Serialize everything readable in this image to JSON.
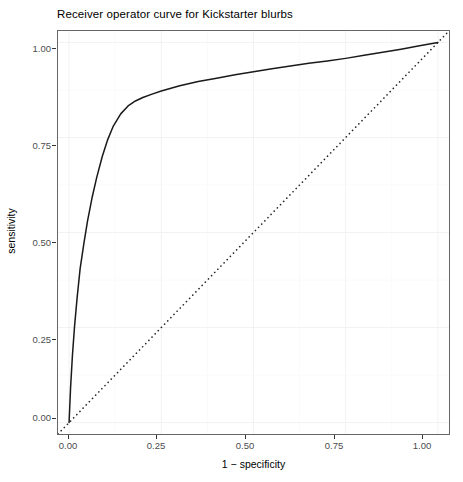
{
  "chart_data": {
    "type": "line",
    "title": "Receiver operator curve for Kickstarter blurbs",
    "xlabel": "1 − specificity",
    "ylabel": "sensitivity",
    "xlim": [
      -0.03,
      1.03
    ],
    "ylim": [
      -0.03,
      1.03
    ],
    "grid": true,
    "legend": "none",
    "x_ticks": [
      0.0,
      0.25,
      0.5,
      0.75,
      1.0
    ],
    "x_tick_labels": [
      "0.00",
      "0.25",
      "0.50",
      "0.75",
      "1.00"
    ],
    "y_ticks": [
      0.0,
      0.25,
      0.5,
      0.75,
      1.0
    ],
    "y_tick_labels": [
      "0.00",
      "0.25",
      "0.50",
      "0.75",
      "1.00"
    ],
    "series": [
      {
        "name": "roc-curve",
        "style": "solid",
        "color": "#1a1a1a",
        "x": [
          0.0,
          0.004,
          0.009,
          0.015,
          0.022,
          0.03,
          0.04,
          0.05,
          0.062,
          0.075,
          0.09,
          0.105,
          0.12,
          0.14,
          0.16,
          0.18,
          0.2,
          0.225,
          0.25,
          0.3,
          0.35,
          0.4,
          0.45,
          0.5,
          0.55,
          0.6,
          0.65,
          0.7,
          0.75,
          0.8,
          0.85,
          0.9,
          0.95,
          1.0
        ],
        "y": [
          0.0,
          0.09,
          0.175,
          0.255,
          0.33,
          0.405,
          0.47,
          0.53,
          0.59,
          0.645,
          0.7,
          0.745,
          0.78,
          0.812,
          0.833,
          0.846,
          0.855,
          0.864,
          0.872,
          0.886,
          0.897,
          0.906,
          0.915,
          0.923,
          0.931,
          0.938,
          0.945,
          0.951,
          0.958,
          0.966,
          0.974,
          0.982,
          0.991,
          1.0
        ]
      },
      {
        "name": "chance-diagonal",
        "style": "dotted",
        "color": "#262626",
        "x": [
          -0.03,
          1.03
        ],
        "y": [
          -0.03,
          1.03
        ]
      }
    ]
  }
}
